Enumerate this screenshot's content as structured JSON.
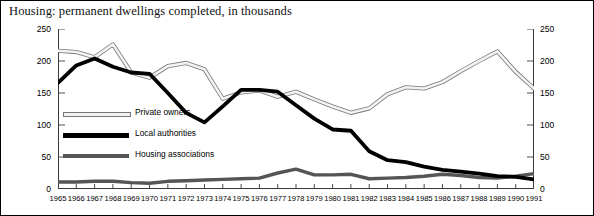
{
  "title": "Housing: permanent dwellings completed, in thousands",
  "axis": {
    "y_ticks_left": [
      "250",
      "200",
      "150",
      "100",
      "50",
      "0"
    ],
    "y_ticks_right": [
      "250",
      "200",
      "150",
      "100",
      "50",
      "0"
    ],
    "x_ticks": [
      "1965",
      "1966",
      "1967",
      "1968",
      "1969",
      "1970",
      "1971",
      "1972",
      "1973",
      "1974",
      "1975",
      "1976",
      "1977",
      "1978",
      "1979",
      "1980",
      "1981",
      "1982",
      "1983",
      "1984",
      "1985",
      "1986",
      "1987",
      "1988",
      "1989",
      "1990",
      "1991"
    ]
  },
  "legend": {
    "items": [
      {
        "label": "Private owners",
        "swatch": "private-owners-swatch",
        "color": "#f2f2f2"
      },
      {
        "label": "Local authorities",
        "swatch": "local-authorities-swatch",
        "color": "#000000"
      },
      {
        "label": "Housing associations",
        "swatch": "housing-associations-swatch",
        "color": "#555555"
      }
    ]
  },
  "chart_data": {
    "type": "line",
    "title": "Housing: permanent dwellings completed, in thousands",
    "xlabel": "",
    "ylabel": "thousands",
    "ylim": [
      0,
      250
    ],
    "yticks": [
      0,
      50,
      100,
      150,
      200,
      250
    ],
    "grid": false,
    "legend_position": "inside-left",
    "dual_axis": true,
    "categories": [
      "1965",
      "1966",
      "1967",
      "1968",
      "1969",
      "1970",
      "1971",
      "1972",
      "1973",
      "1974",
      "1975",
      "1976",
      "1977",
      "1978",
      "1979",
      "1980",
      "1981",
      "1982",
      "1983",
      "1984",
      "1985",
      "1986",
      "1987",
      "1988",
      "1989",
      "1990",
      "1991"
    ],
    "series": [
      {
        "name": "Private owners",
        "color": "#f2f2f2",
        "stroke": "#6b6b6b",
        "values": [
          216,
          214,
          206,
          226,
          182,
          174,
          192,
          197,
          187,
          141,
          151,
          154,
          144,
          152,
          140,
          129,
          119,
          126,
          148,
          159,
          157,
          167,
          184,
          200,
          215,
          183,
          157
        ]
      },
      {
        "name": "Local authorities",
        "color": "#000000",
        "values": [
          166,
          193,
          204,
          191,
          182,
          180,
          150,
          119,
          104,
          129,
          155,
          155,
          152,
          131,
          110,
          93,
          91,
          59,
          45,
          42,
          35,
          30,
          27,
          24,
          20,
          19,
          15
        ]
      },
      {
        "name": "Housing associations",
        "color": "#555555",
        "values": [
          11,
          11,
          12,
          12,
          10,
          9,
          12,
          13,
          14,
          15,
          16,
          17,
          25,
          31,
          22,
          22,
          23,
          16,
          17,
          18,
          20,
          23,
          21,
          18,
          17,
          20,
          24
        ]
      }
    ]
  }
}
